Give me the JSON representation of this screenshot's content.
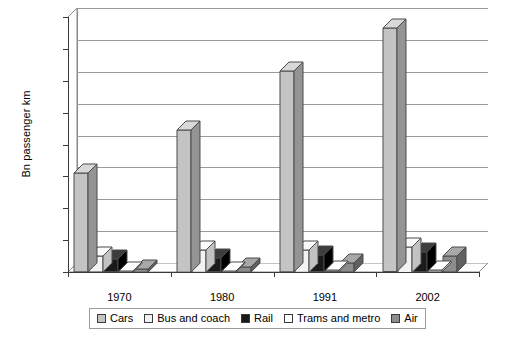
{
  "chart_data": {
    "type": "bar",
    "title": "",
    "subtitle": "",
    "xlabel": "",
    "ylabel": "Bn passenger km",
    "categories": [
      "1970",
      "1980",
      "1991",
      "2002"
    ],
    "ylim": [
      0,
      4000
    ],
    "ytick_values": [
      0,
      500,
      1000,
      1500,
      2000,
      2500,
      3000,
      3500,
      4000
    ],
    "ytick_labels": [
      "0",
      "500",
      "1,000",
      "1,500",
      "2,000",
      "2,500",
      "3,000",
      "3,500",
      "4,000"
    ],
    "grid": true,
    "legend_position": "bottom",
    "style": "3d-clustered-column",
    "series": [
      {
        "name": "Cars",
        "color": "#c4c4c4",
        "side_color": "#949494",
        "top_color": "#d8d8d8",
        "values": [
          1550,
          2230,
          3150,
          3820
        ]
      },
      {
        "name": "Bus and coach",
        "color": "#f2f2f2",
        "side_color": "#c2c2c2",
        "top_color": "#fbfbfb",
        "values": [
          250,
          350,
          350,
          400
        ]
      },
      {
        "name": "Rail",
        "color": "#1a1a1a",
        "side_color": "#000000",
        "top_color": "#3d3d3d",
        "values": [
          200,
          215,
          260,
          310
        ]
      },
      {
        "name": "Trams and metro",
        "color": "#fdfdfd",
        "side_color": "#cccccc",
        "top_color": "#ffffff",
        "values": [
          20,
          20,
          25,
          30
        ]
      },
      {
        "name": "Air",
        "color": "#8c8c8c",
        "side_color": "#616161",
        "top_color": "#a8a8a8",
        "values": [
          50,
          80,
          140,
          250
        ]
      }
    ]
  },
  "axis": {
    "y_title": "Bn passenger km"
  },
  "colors": {
    "grid": "#9a9a9a",
    "axis": "#3a3a3a",
    "wall": "#ffffff",
    "floor": "#ffffff",
    "legend_border": "#9a9a9a",
    "text": "#000000"
  }
}
